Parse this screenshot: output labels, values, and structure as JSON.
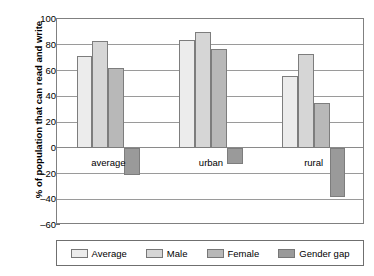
{
  "chart_data": {
    "type": "bar",
    "title": "",
    "xlabel": "",
    "ylabel": "% of population that can read and write",
    "categories": [
      "average",
      "urban",
      "rural"
    ],
    "series": [
      {
        "name": "Average",
        "values": [
          71,
          84,
          56
        ],
        "color": "#ececec"
      },
      {
        "name": "Male",
        "values": [
          83,
          90,
          73
        ],
        "color": "#d6d6d6"
      },
      {
        "name": "Female",
        "values": [
          62,
          77,
          35
        ],
        "color": "#b8b8b8"
      },
      {
        "name": "Gender gap",
        "values": [
          -21,
          -13,
          -38
        ],
        "color": "#9a9a9a"
      }
    ],
    "ylim": [
      -60,
      100
    ],
    "ytick_values": [
      100,
      80,
      60,
      40,
      20,
      0,
      -20,
      -40,
      -60
    ],
    "ytick_labels": [
      "100",
      "80",
      "60",
      "40",
      "20",
      "0",
      "–20",
      "–40",
      "–60"
    ],
    "grid": true,
    "legend_position": "bottom",
    "legend_entries": [
      "Average",
      "Male",
      "Female",
      "Gender gap"
    ]
  }
}
